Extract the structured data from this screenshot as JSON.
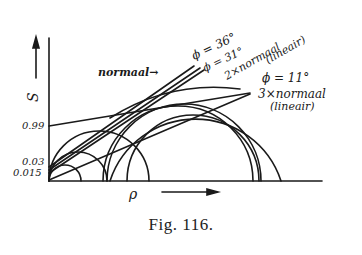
{
  "figure": {
    "caption": "Fig. 116.",
    "axes": {
      "y_label": "S",
      "x_label": "ρ",
      "y_ticks": [
        "0.99",
        "0.03",
        "0.015"
      ]
    },
    "labels": {
      "normaal": "normaal",
      "phi36": "ϕ = 36°",
      "phi31": "ϕ = 31°",
      "two_x_normaal": "2×normaal",
      "lineair_1": "(lineair)",
      "phi11": "ϕ = 11°",
      "three_x_normaal": "3×normaal",
      "lineair_2": "(lineair)"
    },
    "colors": {
      "ink": "#1a1a1a",
      "background": "#ffffff"
    }
  }
}
